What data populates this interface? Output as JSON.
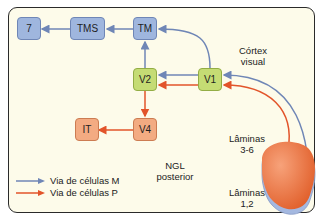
{
  "diagram": {
    "nodes": {
      "n7": {
        "label": "7",
        "color": "#9fb6de"
      },
      "tms": {
        "label": "TMS",
        "color": "#9fb6de"
      },
      "tm": {
        "label": "TM",
        "color": "#9fb6de"
      },
      "v2": {
        "label": "V2",
        "color": "#c5dc74"
      },
      "v1": {
        "label": "V1",
        "color": "#c5dc74"
      },
      "v4": {
        "label": "V4",
        "color": "#f3ab82"
      },
      "it": {
        "label": "IT",
        "color": "#f3ab82"
      }
    },
    "labels": {
      "cortex_line1": "Córtex",
      "cortex_line2": "visual",
      "laminas36_line1": "Lâminas",
      "laminas36_line2": "3-6",
      "ngl_line1": "NGL",
      "ngl_line2": "posterior",
      "laminas12_line1": "Lâminas",
      "laminas12_line2": "1,2"
    },
    "legend": [
      {
        "label": "Via de células M",
        "color": "#6f86b6"
      },
      {
        "label": "Via de células P",
        "color": "#e2542a"
      }
    ],
    "edges": [
      {
        "from": "TMS",
        "to": "7",
        "pathway": "M"
      },
      {
        "from": "TM",
        "to": "TMS",
        "pathway": "M"
      },
      {
        "from": "V1",
        "to": "TM",
        "pathway": "M"
      },
      {
        "from": "V2",
        "to": "TM",
        "pathway": "M"
      },
      {
        "from": "V1",
        "to": "V2",
        "pathway": "M"
      },
      {
        "from": "V1",
        "to": "V2",
        "pathway": "P"
      },
      {
        "from": "V2",
        "to": "V4",
        "pathway": "P"
      },
      {
        "from": "V4",
        "to": "IT",
        "pathway": "P"
      },
      {
        "from": "NGL Lâminas 1,2",
        "to": "V1",
        "pathway": "M"
      },
      {
        "from": "NGL Lâminas 3-6",
        "to": "V1",
        "pathway": "P"
      }
    ]
  }
}
